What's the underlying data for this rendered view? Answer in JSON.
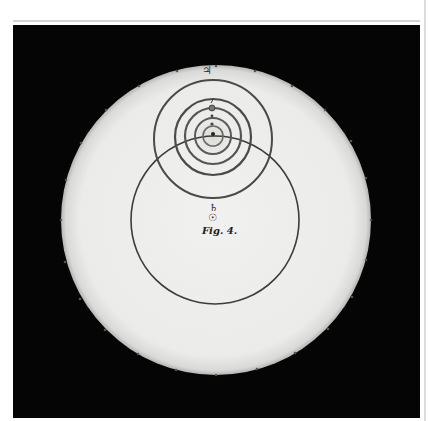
{
  "figure": {
    "caption": "Fig. 4.",
    "background_color": "#050505",
    "disk_color": "#ededeb",
    "ink_color": "#3a3a3a"
  },
  "symbols": {
    "jupiter": "♃",
    "saturn": "♄",
    "sun": "☉",
    "mars": "♂",
    "venus": "♀",
    "mercury": "☿"
  },
  "orbits": [
    {
      "name": "saturn-orbit",
      "cx": 215,
      "cy": 220,
      "r": 84
    },
    {
      "name": "jupiter-orbit",
      "cx": 213,
      "cy": 139,
      "r": 59
    },
    {
      "name": "mars-orbit",
      "cx": 213,
      "cy": 137,
      "r": 38
    },
    {
      "name": "earth-orbit",
      "cx": 213,
      "cy": 136,
      "r": 28
    },
    {
      "name": "venus-orbit",
      "cx": 213,
      "cy": 136,
      "r": 18
    },
    {
      "name": "mercury-orbit",
      "cx": 213,
      "cy": 136,
      "r": 10
    }
  ]
}
